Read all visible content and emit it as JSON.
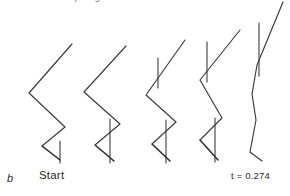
{
  "figure": {
    "panel_letter": "b",
    "clipped_title": "ump height of 0.42 m",
    "start_label": "Start",
    "time_label": "t = 0.274",
    "stroke_color": "#3a3a3a",
    "background_color": "#ffffff"
  },
  "chart_data": {
    "type": "line",
    "title": "ump height of 0.42 m",
    "subtitle": "b",
    "xlabel": "",
    "ylabel": "",
    "xlim": [
      0,
      290
    ],
    "ylim": [
      196,
      0
    ],
    "grid": false,
    "legend": "none",
    "annotations": [
      {
        "text": "b",
        "x": 7,
        "y": 180,
        "style": "italic"
      },
      {
        "text": "Start",
        "x": 39,
        "y": 178
      },
      {
        "text": "t = 0.274",
        "x": 231,
        "y": 178
      },
      {
        "text": "ump height of 0.42 m",
        "x": 62,
        "y": 2,
        "clipped": true
      }
    ],
    "series": [
      {
        "name": "frame-1-body",
        "role": "stick-figure-body",
        "frame": 1,
        "time_label": "Start",
        "points": [
          [
            72,
            44
          ],
          [
            29,
            93
          ],
          [
            65,
            127
          ],
          [
            42,
            146
          ],
          [
            60,
            160
          ]
        ]
      },
      {
        "name": "frame-1-foot",
        "role": "stick-figure-foot",
        "frame": 1,
        "points": [
          [
            60,
            160
          ],
          [
            42,
            146
          ]
        ]
      },
      {
        "name": "frame-1-pole",
        "role": "vertical-pole",
        "frame": 1,
        "points": [
          [
            60,
            141
          ],
          [
            60,
            163
          ]
        ]
      },
      {
        "name": "frame-2-body",
        "role": "stick-figure-body",
        "frame": 2,
        "points": [
          [
            126,
            46
          ],
          [
            84,
            92
          ],
          [
            120,
            124
          ],
          [
            95,
            145
          ],
          [
            114,
            161
          ]
        ]
      },
      {
        "name": "frame-2-foot",
        "role": "stick-figure-foot",
        "frame": 2,
        "points": [
          [
            114,
            161
          ],
          [
            95,
            145
          ]
        ]
      },
      {
        "name": "frame-2-pole",
        "role": "vertical-pole",
        "frame": 2,
        "points": [
          [
            110,
            119
          ],
          [
            110,
            163
          ]
        ]
      },
      {
        "name": "frame-3-body",
        "role": "stick-figure-body",
        "frame": 3,
        "points": [
          [
            185,
            40
          ],
          [
            146,
            95
          ],
          [
            176,
            122
          ],
          [
            152,
            144
          ],
          [
            170,
            161
          ]
        ]
      },
      {
        "name": "frame-3-foot",
        "role": "stick-figure-foot",
        "frame": 3,
        "points": [
          [
            170,
            161
          ],
          [
            152,
            144
          ]
        ]
      },
      {
        "name": "frame-3-pole-upper",
        "role": "vertical-pole",
        "frame": 3,
        "points": [
          [
            158,
            58
          ],
          [
            158,
            88
          ]
        ]
      },
      {
        "name": "frame-3-pole-lower",
        "role": "vertical-pole",
        "frame": 3,
        "points": [
          [
            166,
            120
          ],
          [
            166,
            163
          ]
        ]
      },
      {
        "name": "frame-4-body",
        "role": "stick-figure-body",
        "frame": 4,
        "points": [
          [
            240,
            30
          ],
          [
            200,
            80
          ],
          [
            222,
            118
          ],
          [
            200,
            140
          ],
          [
            218,
            160
          ]
        ]
      },
      {
        "name": "frame-4-foot",
        "role": "stick-figure-foot",
        "frame": 4,
        "points": [
          [
            218,
            160
          ],
          [
            200,
            140
          ]
        ]
      },
      {
        "name": "frame-4-pole-upper",
        "role": "vertical-pole",
        "frame": 4,
        "points": [
          [
            207,
            42
          ],
          [
            207,
            82
          ]
        ]
      },
      {
        "name": "frame-4-pole-lower",
        "role": "vertical-pole",
        "frame": 4,
        "points": [
          [
            215,
            118
          ],
          [
            215,
            162
          ]
        ]
      },
      {
        "name": "frame-5-body",
        "role": "stick-figure-body",
        "frame": 5,
        "time_label": "t = 0.274",
        "points": [
          [
            283,
            2
          ],
          [
            257,
            65
          ],
          [
            252,
            94
          ],
          [
            256,
            120
          ],
          [
            250,
            152
          ],
          [
            262,
            161
          ]
        ]
      },
      {
        "name": "frame-5-pole",
        "role": "vertical-pole",
        "frame": 5,
        "points": [
          [
            259,
            23
          ],
          [
            259,
            76
          ]
        ]
      }
    ]
  }
}
